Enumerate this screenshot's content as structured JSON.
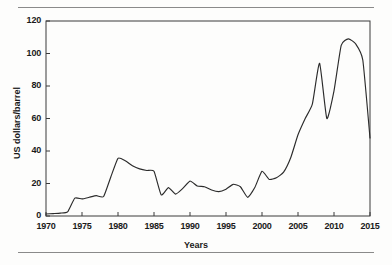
{
  "figure": {
    "background_color": "#fdfdfc",
    "line_color": "#2b2b2b",
    "axis_color": "#3a3a3a",
    "rule_color": "#8a8a8a"
  },
  "chart_data": {
    "type": "line",
    "title": "",
    "subtitle": "",
    "xlabel": "Years",
    "ylabel": "US dollars/barrel",
    "xlim": [
      1970,
      2015
    ],
    "ylim": [
      0,
      120
    ],
    "grid": false,
    "legend": null,
    "xticks": [
      1970,
      1975,
      1980,
      1985,
      1990,
      1995,
      2000,
      2005,
      2010,
      2015
    ],
    "xtick_labels": [
      "1970",
      "1975",
      "1980",
      "1985",
      "1990",
      "1995",
      "2000",
      "2005",
      "2010",
      "2015"
    ],
    "yticks": [
      0,
      20,
      40,
      60,
      80,
      100,
      120
    ],
    "ytick_labels": [
      "0",
      "20",
      "40",
      "60",
      "80",
      "100",
      "120"
    ],
    "series": [
      {
        "name": "Crude oil price",
        "color": "#2b2b2b",
        "x": [
          1970,
          1971,
          1972,
          1973,
          1974,
          1975,
          1976,
          1977,
          1978,
          1979,
          1980,
          1981,
          1982,
          1983,
          1984,
          1985,
          1986,
          1987,
          1988,
          1989,
          1990,
          1991,
          1992,
          1993,
          1994,
          1995,
          1996,
          1997,
          1998,
          1999,
          2000,
          2001,
          2002,
          2003,
          2004,
          2005,
          2006,
          2007,
          2008,
          2009,
          2010,
          2011,
          2012,
          2013,
          2014,
          2015
        ],
        "values": [
          1.2,
          1.5,
          1.8,
          2.5,
          11.0,
          10.5,
          11.5,
          12.5,
          12.0,
          24.0,
          35.5,
          34.0,
          31.0,
          29.0,
          28.0,
          27.5,
          13.0,
          17.5,
          13.5,
          17.0,
          21.5,
          18.5,
          18.0,
          16.0,
          15.0,
          16.5,
          19.5,
          18.0,
          11.5,
          17.5,
          27.5,
          22.5,
          23.5,
          27.0,
          36.0,
          50.0,
          60.0,
          69.0,
          94.0,
          60.0,
          77.0,
          105.0,
          109.0,
          106.0,
          96.0,
          48.0
        ]
      }
    ]
  },
  "axis_titles": {
    "x": "Years",
    "y": "US dollars/barrel"
  }
}
